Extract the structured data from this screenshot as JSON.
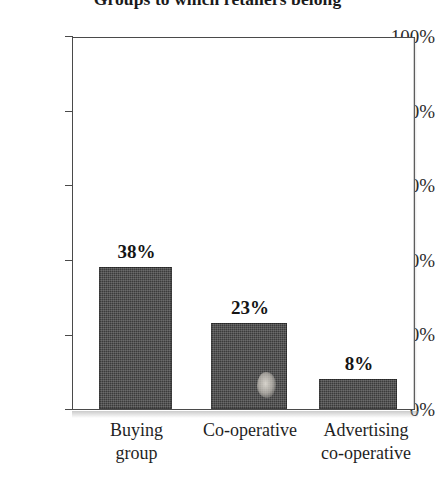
{
  "chart_data": {
    "type": "bar",
    "title": "Groups to which retailers belong",
    "subtitle": "",
    "xlabel": "",
    "ylabel": "",
    "categories": [
      "Buying\ngroup",
      "Co-operative",
      "Advertising\nco-operative"
    ],
    "values": [
      38,
      23,
      8
    ],
    "value_labels": [
      "38%",
      "23%",
      "8%"
    ],
    "ylim": [
      0,
      100
    ],
    "yticks": [
      0,
      20,
      40,
      60,
      80,
      100
    ],
    "ytick_labels": [
      "0%",
      "20%",
      "40%",
      "60%",
      "80%",
      "100%"
    ],
    "grid": false,
    "legend": null,
    "legend_position": "none",
    "bar_color": "#3b3b3b",
    "frame_color": "#4a4a4a",
    "background": "#ffffff"
  },
  "axis": {
    "y": {
      "ticks": [
        {
          "label": "100%",
          "value": 100
        },
        {
          "label": "80%",
          "value": 80
        },
        {
          "label": "60%",
          "value": 60
        },
        {
          "label": "40%",
          "value": 40
        },
        {
          "label": "20%",
          "value": 20
        },
        {
          "label": "0%",
          "value": 0
        }
      ]
    },
    "x": {
      "ticks": [
        {
          "label": "Buying\ngroup"
        },
        {
          "label": "Co-operative"
        },
        {
          "label": "Advertising\nco-operative"
        }
      ]
    }
  },
  "bars": [
    {
      "name": "buying-group",
      "label": "Buying\ngroup",
      "value": 38,
      "value_label": "38%"
    },
    {
      "name": "co-operative",
      "label": "Co-operative",
      "value": 23,
      "value_label": "23%"
    },
    {
      "name": "advertising-co-operative",
      "label": "Advertising\nco-operative",
      "value": 8,
      "value_label": "8%"
    }
  ]
}
